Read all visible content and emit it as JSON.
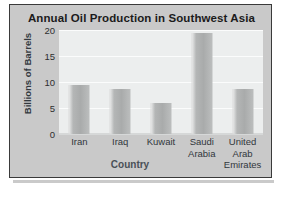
{
  "chart_data": {
    "type": "bar",
    "title": "Annual Oil Production in Southwest Asia",
    "xlabel": "Country",
    "ylabel": "Billions of Barrels",
    "categories": [
      "Iran",
      "Iraq",
      "Kuwait",
      "Saudi Arabia",
      "United Arab Emirates"
    ],
    "category_lines": [
      [
        "Iran"
      ],
      [
        "Iraq"
      ],
      [
        "Kuwait"
      ],
      [
        "Saudi",
        "Arabia"
      ],
      [
        "United",
        "Arab",
        "Emirates"
      ]
    ],
    "values": [
      9.5,
      8.7,
      6.0,
      19.5,
      8.7
    ],
    "ylim": [
      0,
      20
    ],
    "yticks": [
      20,
      15,
      10,
      5,
      0
    ],
    "ytick_labels": [
      "20",
      "15",
      "10",
      "5",
      "0"
    ],
    "grid": true,
    "legend": "none",
    "colors": {
      "bar": "#aeb0b0",
      "panel": "#c9c9c9",
      "plot_background": "#eceeee",
      "frame": "#3a3a3a",
      "title_text": "#1b1b1b",
      "axis_text": "#31373c"
    }
  }
}
